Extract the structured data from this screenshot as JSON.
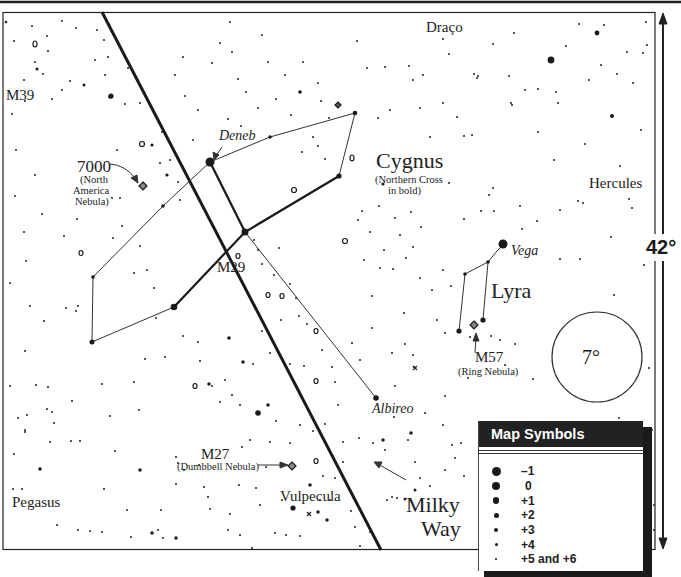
{
  "map": {
    "constellations": {
      "draco": "Draço",
      "cygnus": "Cygnus",
      "cygnus_note_line1": "(Northern Cross",
      "cygnus_note_line2": "in bold)",
      "hercules": "Hercules",
      "lyra": "Lyra",
      "pegasus": "Pegasus",
      "vulpecula": "Vulpecula"
    },
    "stars": {
      "deneb": "Deneb",
      "vega": "Vega",
      "albireo": "Albireo"
    },
    "objects": {
      "m39": "M39",
      "ngc7000": "7000",
      "ngc7000_line1": "(North",
      "ngc7000_line2": "America",
      "ngc7000_line3": "Nebula)",
      "m29": "M29",
      "m57": "M57",
      "m57_note": "(Ring Nebula)",
      "m27": "M27",
      "m27_note": "(Dumbbell Nebula)"
    },
    "milky_way_line1": "Milky",
    "milky_way_line2": "Way",
    "field_circle_label": "7°",
    "scale_label": "42°"
  },
  "legend": {
    "title": "Map Symbols",
    "items": [
      {
        "label": "–1",
        "size": 9
      },
      {
        "label": "0",
        "size": 8
      },
      {
        "label": "+1",
        "size": 6.5
      },
      {
        "label": "+2",
        "size": 5
      },
      {
        "label": "+3",
        "size": 4
      },
      {
        "label": "+4",
        "size": 3
      },
      {
        "label": "+5 and +6",
        "size": 2
      }
    ]
  },
  "colors": {
    "ink": "#1a1a1a",
    "background": "#ffffff",
    "legend_header": "#222222"
  }
}
